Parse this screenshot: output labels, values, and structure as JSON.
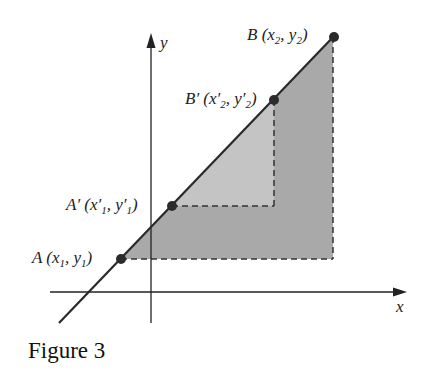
{
  "figure": {
    "caption": "Figure 3",
    "axes": {
      "x_label": "x",
      "y_label": "y"
    },
    "points": {
      "A": {
        "name": "A",
        "coords": "(x1, y1)",
        "label_main": "A (x",
        "sub1": "1",
        "mid": ", y",
        "sub2": "1",
        "end": ")"
      },
      "A_prime": {
        "name": "A′",
        "label_main": "A′ (x′",
        "sub1": "1",
        "mid": ", y′",
        "sub2": "1",
        "end": ")"
      },
      "B_prime": {
        "name": "B′",
        "label_main": "B′ (x′",
        "sub1": "2",
        "mid": ", y′",
        "sub2": "2",
        "end": ")"
      },
      "B": {
        "name": "B",
        "label_main": "B (x",
        "sub1": "2",
        "mid": ", y",
        "sub2": "2",
        "end": ")"
      }
    },
    "colors": {
      "outer_triangle": "#a9a9a9",
      "inner_triangle": "#c4c4c4",
      "line": "#2a2a2a",
      "point": "#2b2b2b"
    }
  }
}
